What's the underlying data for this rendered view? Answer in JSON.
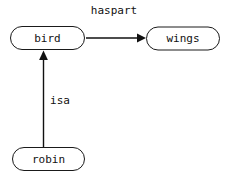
{
  "diagram": {
    "type": "semantic-network",
    "background_color": "#ffffff",
    "stroke_color": "#111111",
    "node_fill": "#ffffff",
    "width": 226,
    "height": 178,
    "nodes": [
      {
        "id": "bird",
        "label": "bird",
        "shape": "stadium",
        "cx": 47.5,
        "cy": 38,
        "w": 75,
        "h": 24
      },
      {
        "id": "wings",
        "label": "wings",
        "shape": "stadium",
        "cx": 183,
        "cy": 38.5,
        "w": 74,
        "h": 24
      },
      {
        "id": "robin",
        "label": "robin",
        "shape": "stadium",
        "cx": 48.5,
        "cy": 159,
        "w": 73,
        "h": 24
      }
    ],
    "edges": [
      {
        "id": "bird-haspart-wings",
        "label": "haspart",
        "from": "bird",
        "to": "wings",
        "direction": "right",
        "label_x": 114,
        "label_y": 11
      },
      {
        "id": "robin-isa-bird",
        "label": "isa",
        "from": "robin",
        "to": "bird",
        "direction": "up",
        "label_x": 60,
        "label_y": 101
      }
    ]
  }
}
